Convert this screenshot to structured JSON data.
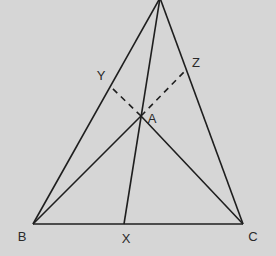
{
  "diagram": {
    "background": "#d6d6d6",
    "stroke_color": "#1e1e1e",
    "points": {
      "P": {
        "x": 160,
        "y": -2,
        "label": ""
      },
      "B": {
        "x": 33,
        "y": 224,
        "label": "B",
        "lx": 22,
        "ly": 236
      },
      "C": {
        "x": 243,
        "y": 224,
        "label": "C",
        "lx": 253,
        "ly": 236
      },
      "X": {
        "x": 124,
        "y": 224,
        "label": "X",
        "lx": 126,
        "ly": 238
      },
      "A": {
        "x": 141,
        "y": 116,
        "label": "A",
        "lx": 152,
        "ly": 118
      },
      "Y": {
        "x": 111,
        "y": 87,
        "label": "Y",
        "lx": 101,
        "ly": 75
      },
      "Z": {
        "x": 186,
        "y": 70,
        "label": "Z",
        "lx": 196,
        "ly": 62
      }
    },
    "segments": [
      {
        "from": "P",
        "to": "B",
        "style": "solid"
      },
      {
        "from": "P",
        "to": "C",
        "style": "solid"
      },
      {
        "from": "B",
        "to": "C",
        "style": "solid"
      },
      {
        "from": "P",
        "to": "X",
        "style": "solid"
      },
      {
        "from": "B",
        "to": "A",
        "style": "solid"
      },
      {
        "from": "C",
        "to": "A",
        "style": "solid"
      },
      {
        "from": "A",
        "to": "Y",
        "style": "dashed"
      },
      {
        "from": "A",
        "to": "Z",
        "style": "dashed"
      }
    ]
  }
}
